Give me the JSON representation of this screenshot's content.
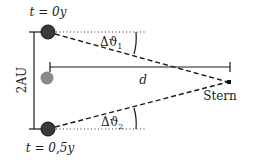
{
  "diagram": {
    "labels": {
      "t_top": "t = 0y",
      "t_bottom": "t = 0,5y",
      "baseline": "2AU",
      "distance": "d",
      "star": "Stern",
      "angle1": "Δϑ",
      "angle1_sub": "1",
      "angle2": "Δϑ",
      "angle2_sub": "2"
    },
    "colors": {
      "earth": "#3a3a3a",
      "sun": "#8a8a8a",
      "line": "#1a1a1a"
    },
    "elements": [
      {
        "name": "earth-position-t0",
        "shape": "circle",
        "cx": 48,
        "cy": 32,
        "r": 7
      },
      {
        "name": "earth-position-t05",
        "shape": "circle",
        "cx": 48,
        "cy": 129,
        "r": 7
      },
      {
        "name": "sun",
        "shape": "circle",
        "cx": 47,
        "cy": 78,
        "r": 6
      },
      {
        "name": "star",
        "shape": "point",
        "x": 229,
        "y": 82
      }
    ]
  }
}
